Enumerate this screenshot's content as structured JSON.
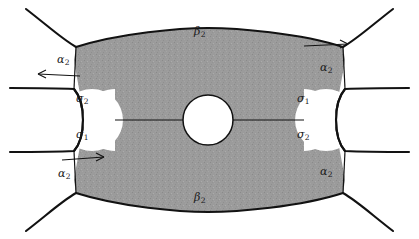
{
  "figure": {
    "background_color": "#ffffff",
    "shaded_fill": "#9a9a9a",
    "stroke_color": "#121212",
    "width": 419,
    "height": 239
  },
  "labels": {
    "beta_top": {
      "text": "β",
      "sub": "2",
      "x": 196,
      "y": 32
    },
    "beta_bottom": {
      "text": "β",
      "sub": "2",
      "x": 196,
      "y": 198
    },
    "alpha_top_left": {
      "text": "α",
      "sub": "2",
      "x": 61,
      "y": 55
    },
    "alpha_top_right": {
      "text": "α",
      "sub": "2",
      "x": 322,
      "y": 63
    },
    "alpha_bottom_left": {
      "text": "α",
      "sub": "2",
      "x": 62,
      "y": 170
    },
    "alpha_bottom_right": {
      "text": "α",
      "sub": "2",
      "x": 322,
      "y": 168
    },
    "sigma_left_upper": {
      "text": "σ",
      "sub": "2",
      "x": 80,
      "y": 96
    },
    "sigma_left_lower": {
      "text": "σ",
      "sub": "1",
      "x": 80,
      "y": 132
    },
    "sigma_right_upper": {
      "text": "σ",
      "sub": "1",
      "x": 300,
      "y": 96
    },
    "sigma_right_lower": {
      "text": "σ",
      "sub": "2",
      "x": 300,
      "y": 132
    }
  },
  "elements": {
    "central_circle": {
      "name": "central-boundary-circle",
      "cx": 208,
      "cy": 120,
      "r": 25
    },
    "left_hole": {
      "name": "left-boundary-hole",
      "cx": 92,
      "cy": 120,
      "r": 31
    },
    "right_hole": {
      "name": "right-boundary-hole",
      "cx": 326,
      "cy": 120,
      "r": 31
    },
    "horizontal_seam": {
      "name": "horizontal-seam-line",
      "y": 120
    },
    "arrows": [
      {
        "name": "arrow-top-left",
        "direction": "left",
        "x": 68,
        "y": 78
      },
      {
        "name": "arrow-top-right",
        "direction": "right",
        "x": 330,
        "y": 48
      },
      {
        "name": "arrow-bottom-left",
        "direction": "right",
        "x": 76,
        "y": 157
      }
    ]
  }
}
